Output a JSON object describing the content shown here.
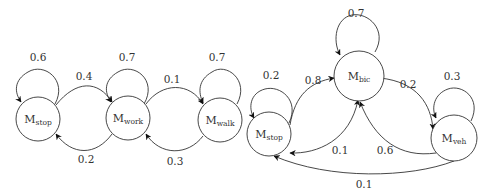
{
  "diagrams": [
    {
      "name": "left-markov-chain",
      "nodes": [
        {
          "id": "stop_l",
          "main": "M",
          "sub": "stop"
        },
        {
          "id": "work",
          "main": "M",
          "sub": "work"
        },
        {
          "id": "walk",
          "main": "M",
          "sub": "walk"
        }
      ],
      "edges": [
        {
          "from": "stop_l",
          "to": "stop_l",
          "label": "0.6"
        },
        {
          "from": "work",
          "to": "work",
          "label": "0.7"
        },
        {
          "from": "walk",
          "to": "walk",
          "label": "0.7"
        },
        {
          "from": "stop_l",
          "to": "work",
          "label": "0.4"
        },
        {
          "from": "work",
          "to": "stop_l",
          "label": "0.2"
        },
        {
          "from": "work",
          "to": "walk",
          "label": "0.1"
        },
        {
          "from": "walk",
          "to": "work",
          "label": "0.3"
        }
      ]
    },
    {
      "name": "right-markov-chain",
      "nodes": [
        {
          "id": "stop_r",
          "main": "M",
          "sub": "stop"
        },
        {
          "id": "bic",
          "main": "M",
          "sub": "bic"
        },
        {
          "id": "veh",
          "main": "M",
          "sub": "veh"
        }
      ],
      "edges": [
        {
          "from": "stop_r",
          "to": "stop_r",
          "label": "0.2"
        },
        {
          "from": "bic",
          "to": "bic",
          "label": "0.7"
        },
        {
          "from": "veh",
          "to": "veh",
          "label": "0.3"
        },
        {
          "from": "stop_r",
          "to": "bic",
          "label": "0.8"
        },
        {
          "from": "bic",
          "to": "stop_r",
          "label": "0.1"
        },
        {
          "from": "bic",
          "to": "veh",
          "label": "0.2"
        },
        {
          "from": "veh",
          "to": "bic",
          "label": "0.6"
        },
        {
          "from": "veh",
          "to": "stop_r",
          "label": "0.1"
        }
      ]
    }
  ]
}
